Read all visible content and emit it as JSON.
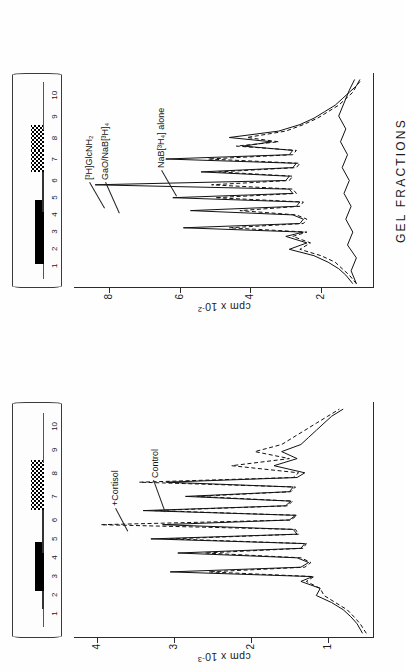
{
  "figure": {
    "orientation": "rotated-90-ccw",
    "x_axis_label": "GEL  FRACTIONS"
  },
  "panels": [
    {
      "id": "lower-panel",
      "y_axis_label_text": "cpm x 10",
      "y_axis_label_exp": "-3",
      "y_ticks": [
        "4",
        "3",
        "2",
        "1"
      ],
      "gel": {
        "band_numbers": [
          "1",
          "2",
          "3",
          "4",
          "5",
          "6",
          "7",
          "8",
          "9",
          "10"
        ]
      },
      "curve_labels": [
        {
          "name": "cortisol-label",
          "text": "+Cortisol"
        },
        {
          "name": "control-label",
          "text": "Control"
        }
      ]
    },
    {
      "id": "upper-panel",
      "y_axis_label_text": "cpm x 10",
      "y_axis_label_exp": "-2",
      "y_ticks": [
        "8",
        "6",
        "4",
        "2"
      ],
      "gel": {
        "band_numbers": [
          "1",
          "2",
          "3",
          "4",
          "5",
          "6",
          "7",
          "8",
          "9",
          "10"
        ]
      },
      "curve_labels": [
        {
          "name": "glcnh2-label",
          "text": "[³H]GlcNH₂"
        },
        {
          "name": "gao-nab-label",
          "text": "GaO/NaB[³H]₄"
        },
        {
          "name": "nab-alone-label",
          "text": "NaB[³H₄] alone"
        }
      ]
    }
  ],
  "chart_data": {
    "type": "line",
    "title": "",
    "xlabel": "GEL FRACTIONS",
    "grid": false,
    "legend": "inline-annotations",
    "subplots": [
      {
        "id": "lower-panel",
        "ylabel": "cpm x 10^-3",
        "ylim": [
          0.4,
          4.3
        ],
        "yticks": [
          1,
          2,
          3,
          4
        ],
        "xlim": [
          0,
          100
        ],
        "gel_band_numbers": [
          1,
          2,
          3,
          4,
          5,
          6,
          7,
          8,
          9,
          10
        ],
        "gel_band_positions_pct": [
          10,
          18,
          26,
          34,
          42,
          50,
          60,
          70,
          80,
          90
        ],
        "gel_band_intensity": [
          "faint",
          "thin",
          "thick",
          "thick",
          "thin",
          "thin",
          "checker",
          "checker",
          "faint",
          "faint"
        ],
        "series": [
          {
            "name": "Control",
            "style": "solid",
            "x": [
              2,
              6,
              9,
              12,
              15,
              18,
              21,
              24,
              26,
              28,
              30,
              32,
              34,
              36,
              38,
              40,
              42,
              44,
              46,
              48,
              50,
              52,
              54,
              56,
              58,
              60,
              62,
              64,
              66,
              68,
              70,
              73,
              76,
              79,
              82,
              85,
              88,
              91,
              94,
              97
            ],
            "y": [
              0.55,
              0.62,
              0.7,
              0.8,
              0.95,
              1.15,
              1.1,
              1.35,
              1.2,
              3.05,
              1.35,
              1.25,
              1.4,
              2.95,
              1.35,
              1.3,
              3.3,
              1.4,
              1.45,
              3.15,
              1.5,
              1.42,
              3.4,
              1.55,
              1.48,
              2.85,
              1.5,
              1.45,
              3.1,
              1.4,
              1.3,
              1.7,
              1.4,
              1.6,
              1.35,
              1.25,
              1.15,
              1.05,
              0.95,
              0.8
            ]
          },
          {
            "name": "+Cortisol",
            "style": "dashed",
            "x": [
              2,
              6,
              9,
              12,
              15,
              18,
              21,
              24,
              26,
              28,
              30,
              32,
              34,
              36,
              38,
              40,
              42,
              44,
              46,
              48,
              50,
              52,
              54,
              56,
              58,
              60,
              62,
              64,
              66,
              68,
              70,
              73,
              76,
              79,
              82,
              85,
              88,
              91,
              94,
              97
            ],
            "y": [
              0.5,
              0.58,
              0.66,
              0.75,
              0.9,
              1.05,
              1.1,
              1.28,
              1.18,
              2.55,
              1.3,
              1.22,
              1.35,
              2.6,
              1.32,
              1.28,
              3.05,
              1.38,
              1.42,
              3.95,
              1.48,
              1.4,
              3.25,
              1.52,
              1.46,
              2.7,
              1.48,
              1.42,
              3.45,
              1.45,
              1.38,
              2.25,
              1.5,
              1.95,
              1.6,
              1.45,
              1.3,
              1.15,
              1.0,
              0.85
            ]
          }
        ]
      },
      {
        "id": "upper-panel",
        "ylabel": "cpm x 10^-2",
        "ylim": [
          0.5,
          9.0
        ],
        "yticks": [
          2,
          4,
          6,
          8
        ],
        "xlim": [
          0,
          100
        ],
        "gel_band_numbers": [
          1,
          2,
          3,
          4,
          5,
          6,
          7,
          8,
          9,
          10
        ],
        "gel_band_positions_pct": [
          10,
          18,
          26,
          34,
          42,
          50,
          60,
          70,
          80,
          90
        ],
        "gel_band_intensity": [
          "faint",
          "thick",
          "thick",
          "thick",
          "thin",
          "thin",
          "checker",
          "checker",
          "faint",
          "faint"
        ],
        "series": [
          {
            "name": "[3H]GlcNH2",
            "style": "solid",
            "x": [
              2,
              6,
              9,
              12,
              15,
              18,
              21,
              24,
              26,
              28,
              30,
              32,
              34,
              36,
              38,
              40,
              42,
              44,
              46,
              48,
              50,
              52,
              54,
              56,
              58,
              60,
              62,
              64,
              66,
              68,
              70,
              73,
              76,
              79,
              82,
              85,
              88,
              91,
              94,
              97
            ],
            "y": [
              1.1,
              1.3,
              1.5,
              1.8,
              2.2,
              2.9,
              2.4,
              3.0,
              2.5,
              5.9,
              2.6,
              2.5,
              2.8,
              5.7,
              2.7,
              2.6,
              6.2,
              2.8,
              2.9,
              8.4,
              3.0,
              2.9,
              5.4,
              2.8,
              2.7,
              6.4,
              2.9,
              2.8,
              4.2,
              3.4,
              4.6,
              3.2,
              2.6,
              2.2,
              1.9,
              1.6,
              1.4,
              1.2,
              1.0,
              0.9
            ]
          },
          {
            "name": "GaO/NaB[3H]4",
            "style": "dashed",
            "x": [
              2,
              6,
              9,
              12,
              15,
              18,
              21,
              24,
              26,
              28,
              30,
              32,
              34,
              36,
              38,
              40,
              42,
              44,
              46,
              48,
              50,
              52,
              54,
              56,
              58,
              60,
              62,
              64,
              66,
              68,
              70,
              73,
              76,
              79,
              82,
              85,
              88,
              91,
              94,
              97
            ],
            "y": [
              1.0,
              1.2,
              1.4,
              1.6,
              2.0,
              2.6,
              2.3,
              2.8,
              2.4,
              4.6,
              2.5,
              2.4,
              2.7,
              4.3,
              2.6,
              2.5,
              5.0,
              2.7,
              2.8,
              5.1,
              2.9,
              2.8,
              4.9,
              2.7,
              2.6,
              5.2,
              2.8,
              2.7,
              4.4,
              3.2,
              4.1,
              3.0,
              2.5,
              2.1,
              1.8,
              1.5,
              1.3,
              1.1,
              1.0,
              0.85
            ]
          },
          {
            "name": "NaB[3H4] alone",
            "style": "solid",
            "x": [
              2,
              8,
              14,
              20,
              26,
              32,
              38,
              44,
              50,
              56,
              62,
              68,
              74,
              80,
              86,
              92,
              97
            ],
            "y": [
              1.0,
              1.15,
              1.0,
              1.25,
              1.1,
              1.3,
              1.15,
              1.35,
              1.2,
              1.4,
              1.25,
              1.45,
              1.3,
              1.5,
              1.35,
              1.2,
              1.05
            ]
          }
        ]
      }
    ]
  }
}
